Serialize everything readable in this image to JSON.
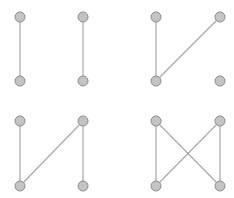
{
  "figure": {
    "style": {
      "node_fill": "#c4c4c4",
      "node_stroke": "#8c8c8c",
      "edge_color": "#a8a8a8",
      "node_radius": 5
    },
    "graphs": [
      {
        "id": "graph-1",
        "nodes": [
          {
            "id": "a",
            "x": 20,
            "y": 17
          },
          {
            "id": "b",
            "x": 83,
            "y": 17
          },
          {
            "id": "c",
            "x": 20,
            "y": 81
          },
          {
            "id": "d",
            "x": 83,
            "y": 81
          }
        ],
        "edges": [
          [
            "a",
            "c"
          ],
          [
            "b",
            "d"
          ]
        ]
      },
      {
        "id": "graph-2",
        "nodes": [
          {
            "id": "a",
            "x": 156,
            "y": 17
          },
          {
            "id": "b",
            "x": 220,
            "y": 17
          },
          {
            "id": "c",
            "x": 156,
            "y": 81
          },
          {
            "id": "d",
            "x": 220,
            "y": 81
          }
        ],
        "edges": [
          [
            "a",
            "c"
          ],
          [
            "b",
            "c"
          ]
        ]
      },
      {
        "id": "graph-3",
        "nodes": [
          {
            "id": "a",
            "x": 20,
            "y": 121
          },
          {
            "id": "b",
            "x": 83,
            "y": 121
          },
          {
            "id": "c",
            "x": 20,
            "y": 186
          },
          {
            "id": "d",
            "x": 83,
            "y": 186
          }
        ],
        "edges": [
          [
            "a",
            "c"
          ],
          [
            "b",
            "c"
          ],
          [
            "b",
            "d"
          ]
        ]
      },
      {
        "id": "graph-4",
        "nodes": [
          {
            "id": "a",
            "x": 156,
            "y": 121
          },
          {
            "id": "b",
            "x": 220,
            "y": 121
          },
          {
            "id": "c",
            "x": 156,
            "y": 186
          },
          {
            "id": "d",
            "x": 220,
            "y": 186
          }
        ],
        "edges": [
          [
            "a",
            "c"
          ],
          [
            "a",
            "d"
          ],
          [
            "b",
            "c"
          ],
          [
            "b",
            "d"
          ]
        ]
      }
    ]
  }
}
